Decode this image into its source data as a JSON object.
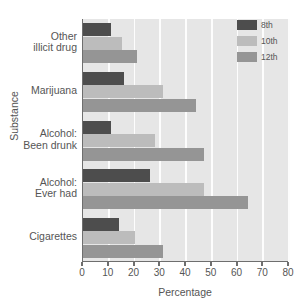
{
  "chart_data": {
    "type": "bar",
    "orientation": "horizontal",
    "title": "",
    "xlabel": "Percentage",
    "ylabel": "Substance",
    "xlim": [
      0,
      80
    ],
    "xticks": [
      0,
      10,
      20,
      30,
      40,
      50,
      60,
      70,
      80
    ],
    "grid": "vertical-white",
    "legend_position": "top-right",
    "categories": [
      "Cigarettes",
      "Alcohol:\nEver had",
      "Alcohol:\nBeen drunk",
      "Marijuana",
      "Other\nillicit drug"
    ],
    "category_lines": [
      [
        "Cigarettes"
      ],
      [
        "Alcohol:",
        "Ever had"
      ],
      [
        "Alcohol:",
        "Been drunk"
      ],
      [
        "Marijuana"
      ],
      [
        "Other",
        "illicit drug"
      ]
    ],
    "series": [
      {
        "name": "8th",
        "color": "#4d4d4d",
        "values": [
          14,
          26,
          11,
          16,
          11
        ]
      },
      {
        "name": "10th",
        "color": "#bcbcbc",
        "values": [
          20,
          47,
          28,
          31,
          15
        ]
      },
      {
        "name": "12th",
        "color": "#959595",
        "values": [
          31,
          64,
          47,
          44,
          21
        ]
      }
    ]
  },
  "colors": {
    "plot_background": "#e6e6e6",
    "page_background": "#ffffff",
    "gridline": "#fdfdfd",
    "axis": "#6e6e6e",
    "text": "#555555"
  }
}
